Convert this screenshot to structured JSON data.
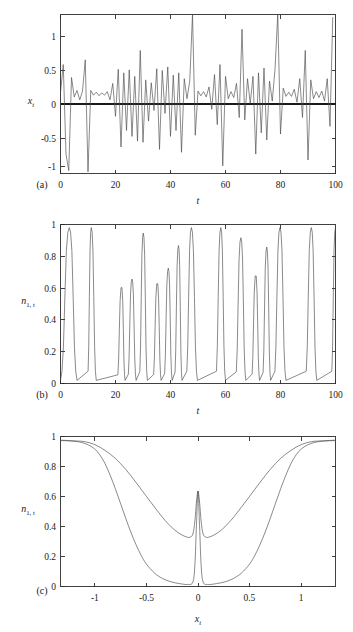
{
  "figure": {
    "name": "three-panel-time-series-figure",
    "background_color": "#ffffff",
    "curve_color": "#4a4a4a",
    "axis_color": "#2b2b2b"
  },
  "panels": [
    {
      "id": "a",
      "letter": "(a)",
      "xlabel": "t",
      "ylabel_base": "x",
      "ylabel_sub": "t",
      "ylabel": "x_t"
    },
    {
      "id": "b",
      "letter": "(b)",
      "xlabel": "t",
      "ylabel_base": "n",
      "ylabel_sub": "1, t",
      "ylabel": "n_1,t"
    },
    {
      "id": "c",
      "letter": "(c)",
      "xlabel_base": "x",
      "xlabel_sub": "t",
      "xlabel": "x_t",
      "ylabel_base": "n",
      "ylabel_sub": "1, t",
      "ylabel": "n_1,t"
    }
  ],
  "ticklabels": {
    "a_y": [
      "1",
      "0.5",
      "0",
      "-0.5",
      "-1"
    ],
    "a_x": [
      "0",
      "20",
      "40",
      "60",
      "80",
      "100"
    ],
    "b_y": [
      "1",
      "0.8",
      "0.6",
      "0.4",
      "0.2",
      "0"
    ],
    "b_x": [
      "0",
      "20",
      "40",
      "60",
      "80",
      "100"
    ],
    "c_y": [
      "1",
      "0.8",
      "0.6",
      "0.4",
      "0.2",
      "0"
    ],
    "c_x": [
      "-1",
      "-0.5",
      "0",
      "0.5",
      "1"
    ]
  },
  "chart_data": [
    {
      "type": "line",
      "id": "panel-a",
      "title": "",
      "xlabel": "t",
      "ylabel": "x_t",
      "xlim": [
        0,
        100
      ],
      "ylim": [
        -1.35,
        1.35
      ],
      "yticks": [
        -1,
        -0.5,
        0,
        0.5,
        1
      ],
      "xticks": [
        0,
        20,
        40,
        60,
        80,
        100
      ],
      "grid": false,
      "legend": "none",
      "series": [
        {
          "name": "x_t",
          "color": "#4a4a4a",
          "x": [
            0,
            1,
            2,
            3,
            4,
            5,
            6,
            7,
            8,
            9,
            10,
            11,
            12,
            13,
            14,
            15,
            16,
            17,
            18,
            19,
            20,
            21,
            22,
            23,
            24,
            25,
            26,
            27,
            28,
            29,
            30,
            31,
            32,
            33,
            34,
            35,
            36,
            37,
            38,
            39,
            40,
            41,
            42,
            43,
            44,
            45,
            46,
            47,
            48,
            49,
            50,
            51,
            52,
            53,
            54,
            55,
            56,
            57,
            58,
            59,
            60,
            61,
            62,
            63,
            64,
            65,
            66,
            67,
            68,
            69,
            70,
            71,
            72,
            73,
            74,
            75,
            76,
            77,
            78,
            79,
            80,
            81,
            82,
            83,
            84,
            85,
            86,
            87,
            88,
            89,
            90,
            91,
            92,
            93,
            94,
            95,
            96,
            97,
            98,
            99,
            100
          ],
          "values": [
            0.02,
            0.5,
            -1.02,
            -1.3,
            0.28,
            -0.05,
            0.06,
            -0.1,
            0.05,
            0.58,
            -1.32,
            0.06,
            -0.02,
            0.03,
            -0.03,
            0.02,
            -0.02,
            0.04,
            -0.1,
            0.18,
            -0.38,
            0.42,
            -0.9,
            0.36,
            -0.62,
            0.41,
            -0.72,
            0.3,
            -0.8,
            0.74,
            -0.82,
            0.24,
            -0.46,
            0.19,
            -0.28,
            0.43,
            -0.94,
            0.4,
            -0.33,
            0.46,
            -0.72,
            0.32,
            -0.62,
            0.36,
            -0.99,
            0.26,
            -0.08,
            0.22,
            1.36,
            -0.7,
            0.05,
            -0.03,
            0.04,
            -0.05,
            0.12,
            -0.26,
            0.33,
            -0.52,
            0.5,
            -1.22,
            0.3,
            -0.08,
            0.04,
            -0.06,
            0.18,
            -0.4,
            1.1,
            -0.44,
            0.26,
            -0.16,
            0.3,
            -1.02,
            0.36,
            -0.66,
            0.44,
            -0.78,
            0.22,
            -0.12,
            0.42,
            1.36,
            -0.68,
            0.1,
            -0.04,
            0.03,
            -0.04,
            0.08,
            -0.14,
            0.26,
            -0.4,
            0.74,
            -1.12,
            0.24,
            -0.08,
            0.04,
            -0.06,
            0.05,
            -0.12,
            0.26,
            -0.55,
            1.3
          ]
        }
      ]
    },
    {
      "type": "line",
      "id": "panel-b",
      "title": "",
      "xlabel": "t",
      "ylabel": "n_1,t",
      "xlim": [
        0,
        100
      ],
      "ylim": [
        0,
        1.02
      ],
      "yticks": [
        0,
        0.2,
        0.4,
        0.6,
        0.8,
        1
      ],
      "xticks": [
        0,
        20,
        40,
        60,
        80,
        100
      ],
      "grid": false,
      "legend": "none",
      "series": [
        {
          "name": "n_1,t",
          "color": "#4a4a4a",
          "description": "pulse train switching between ~0 and ~1 with narrow spikes",
          "pulses": [
            {
              "start": 0.0,
              "peak_x": 3.2,
              "peak_y": 1.0,
              "end": 6.0,
              "flat": false
            },
            {
              "start": 9.8,
              "peak_x": 11.2,
              "peak_y": 1.0,
              "end": 13.0,
              "flat": false
            },
            {
              "start": 20.6,
              "peak_x": 22.2,
              "peak_y": 0.615,
              "end": 23.5,
              "flat": true
            },
            {
              "start": 24.4,
              "peak_x": 26.0,
              "peak_y": 0.67,
              "end": 27.5,
              "flat": false
            },
            {
              "start": 28.6,
              "peak_x": 30.1,
              "peak_y": 0.965,
              "end": 31.6,
              "flat": false
            },
            {
              "start": 33.6,
              "peak_x": 35.2,
              "peak_y": 0.64,
              "end": 36.6,
              "flat": true
            },
            {
              "start": 37.6,
              "peak_x": 39.2,
              "peak_y": 0.74,
              "end": 40.6,
              "flat": false
            },
            {
              "start": 41.4,
              "peak_x": 42.9,
              "peak_y": 0.885,
              "end": 44.2,
              "flat": false
            },
            {
              "start": 45.6,
              "peak_x": 47.6,
              "peak_y": 1.0,
              "end": 49.8,
              "flat": false
            },
            {
              "start": 56.4,
              "peak_x": 58.3,
              "peak_y": 1.0,
              "end": 60.0,
              "flat": false
            },
            {
              "start": 63.6,
              "peak_x": 65.6,
              "peak_y": 0.935,
              "end": 67.4,
              "flat": false
            },
            {
              "start": 69.4,
              "peak_x": 71.0,
              "peak_y": 0.69,
              "end": 72.4,
              "flat": true
            },
            {
              "start": 73.4,
              "peak_x": 75.0,
              "peak_y": 0.875,
              "end": 76.4,
              "flat": false
            },
            {
              "start": 77.6,
              "peak_x": 79.8,
              "peak_y": 1.0,
              "end": 82.0,
              "flat": false
            },
            {
              "start": 89.0,
              "peak_x": 91.2,
              "peak_y": 1.0,
              "end": 93.2,
              "flat": false
            },
            {
              "start": 98.4,
              "peak_x": 100.0,
              "peak_y": 1.0,
              "end": 100.0,
              "flat": false
            }
          ],
          "baseline": 0.02
        }
      ]
    },
    {
      "type": "line",
      "id": "panel-c",
      "title": "",
      "xlabel": "x_t",
      "ylabel": "n_1,t",
      "xlim": [
        -1.33,
        1.33
      ],
      "ylim": [
        0,
        1.03
      ],
      "yticks": [
        0,
        0.2,
        0.4,
        0.6,
        0.8,
        1
      ],
      "xticks": [
        -1,
        -0.5,
        0,
        0.5,
        1
      ],
      "grid": false,
      "legend": "none",
      "series": [
        {
          "name": "upper-u-curve",
          "color": "#4a4a4a",
          "description": "U-shaped curve falling from 1 at the edges to ~0.34 near the centre, with a narrow central spike reaching ~0.655 at x=0",
          "x": [
            -1.33,
            -1.2,
            -1.1,
            -1.0,
            -0.9,
            -0.8,
            -0.7,
            -0.6,
            -0.5,
            -0.42,
            -0.34,
            -0.26,
            -0.2,
            -0.15,
            -0.11,
            -0.08,
            -0.05,
            -0.03,
            -0.015,
            0.0,
            0.015,
            0.03,
            0.05,
            0.08,
            0.11,
            0.15,
            0.2,
            0.26,
            0.34,
            0.42,
            0.5,
            0.6,
            0.7,
            0.8,
            0.9,
            1.0,
            1.1,
            1.2,
            1.33
          ],
          "values": [
            1.005,
            1.0,
            0.995,
            0.975,
            0.935,
            0.88,
            0.805,
            0.715,
            0.62,
            0.545,
            0.472,
            0.41,
            0.374,
            0.352,
            0.34,
            0.338,
            0.36,
            0.45,
            0.58,
            0.655,
            0.58,
            0.45,
            0.36,
            0.338,
            0.34,
            0.352,
            0.374,
            0.41,
            0.472,
            0.545,
            0.62,
            0.715,
            0.805,
            0.88,
            0.935,
            0.975,
            0.995,
            1.0,
            1.005
          ]
        },
        {
          "name": "lower-bathtub-curve",
          "color": "#4a4a4a",
          "description": "Bathtub/sigmoid curve at 1 near the edges, dropping steeply near |x|~0.9 to near 0 across the centre, with a narrow central spike to ~0.655",
          "x": [
            -1.33,
            -1.25,
            -1.18,
            -1.12,
            -1.06,
            -1.0,
            -0.95,
            -0.9,
            -0.85,
            -0.8,
            -0.75,
            -0.7,
            -0.65,
            -0.6,
            -0.55,
            -0.5,
            -0.42,
            -0.34,
            -0.26,
            -0.18,
            -0.1,
            -0.05,
            -0.03,
            -0.015,
            0.0,
            0.015,
            0.03,
            0.05,
            0.1,
            0.18,
            0.26,
            0.34,
            0.42,
            0.5,
            0.55,
            0.6,
            0.65,
            0.7,
            0.75,
            0.8,
            0.85,
            0.9,
            0.95,
            1.0,
            1.06,
            1.12,
            1.18,
            1.25,
            1.33
          ],
          "values": [
            1.002,
            1.0,
            0.996,
            0.988,
            0.972,
            0.945,
            0.905,
            0.845,
            0.765,
            0.672,
            0.572,
            0.47,
            0.374,
            0.288,
            0.214,
            0.155,
            0.092,
            0.054,
            0.032,
            0.02,
            0.014,
            0.03,
            0.15,
            0.42,
            0.655,
            0.42,
            0.15,
            0.03,
            0.014,
            0.02,
            0.032,
            0.054,
            0.092,
            0.155,
            0.214,
            0.288,
            0.374,
            0.47,
            0.572,
            0.672,
            0.765,
            0.845,
            0.905,
            0.945,
            0.972,
            0.988,
            0.996,
            1.0,
            1.002
          ]
        }
      ]
    }
  ]
}
